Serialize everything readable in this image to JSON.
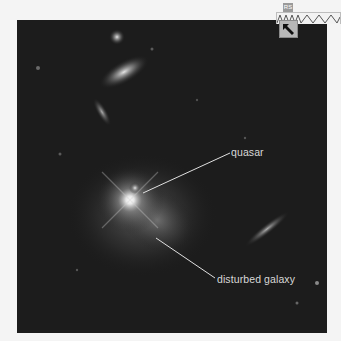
{
  "image": {
    "subject": "quasar host galaxy field",
    "background_color": "#1c1c1c"
  },
  "labels": {
    "quasar": "quasar",
    "disturbed_galaxy": "disturbed galaxy"
  },
  "toolbar": {
    "tab_label": "RS",
    "pointer_icon": "arrow-pointer-icon"
  },
  "colors": {
    "label_text": "#d8d8d8",
    "leader_line": "#e0e0e0"
  }
}
